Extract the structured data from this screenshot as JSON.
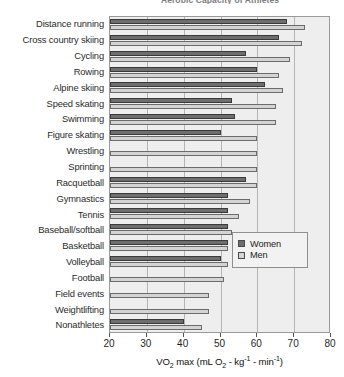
{
  "chart_data": {
    "type": "bar",
    "orientation": "horizontal",
    "title": "Aerobic Capacity of Athletes",
    "xlabel": "VO2 max (mL O2 - kg-1 - min-1)",
    "ylabel": "",
    "xlim": [
      20,
      80
    ],
    "xticks": [
      20,
      30,
      40,
      50,
      60,
      70,
      80
    ],
    "xtick_labels": [
      "20",
      "30",
      "40",
      "50",
      "60",
      "70",
      "80"
    ],
    "grid": true,
    "legend_position": "center-right",
    "categories": [
      "Distance running",
      "Cross country skiing",
      "Cycling",
      "Rowing",
      "Alpine skiing",
      "Speed skating",
      "Swimming",
      "Figure skating",
      "Wrestling",
      "Sprinting",
      "Racquetball",
      "Gymnastics",
      "Tennis",
      "Baseball/softball",
      "Basketball",
      "Volleyball",
      "Football",
      "Field events",
      "Weightlifting",
      "Nonathletes"
    ],
    "series": [
      {
        "name": "Women",
        "color": "#6e6e6e",
        "values": [
          68,
          66,
          57,
          60,
          62,
          53,
          54,
          50,
          null,
          null,
          57,
          52,
          52,
          52,
          52,
          50,
          null,
          null,
          null,
          40
        ]
      },
      {
        "name": "Men",
        "color": "#d4d4d4",
        "values": [
          73,
          72,
          69,
          66,
          67,
          65,
          65,
          60,
          60,
          60,
          60,
          58,
          55,
          53,
          52,
          52,
          51,
          47,
          47,
          45
        ]
      }
    ]
  },
  "axis_title_parts": {
    "lead": "VO",
    "sub1": "2",
    "mid": " max (mL O",
    "sub2": "2",
    "dot1": " - kg",
    "sup1": "-1",
    "dot2": " - min",
    "sup2": "-1",
    "close": ")"
  },
  "legend": {
    "entries": [
      {
        "label": "Women",
        "swatch": "women"
      },
      {
        "label": "Men",
        "swatch": "men"
      }
    ]
  },
  "colors": {
    "women_fill": "#6e6e6e",
    "men_fill": "#d4d4d4",
    "plot_bg": "#eeeeee",
    "gridline": "#b4b4b4",
    "axis": "#9a9a9a"
  }
}
